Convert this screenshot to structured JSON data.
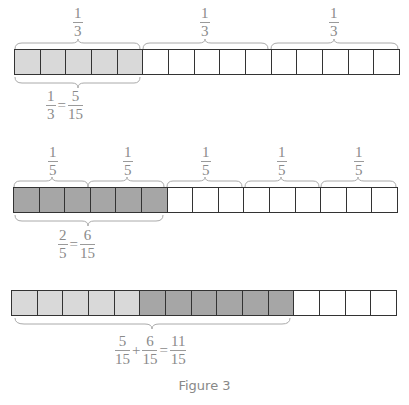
{
  "colors": {
    "light_fill": "#d9d9d9",
    "dark_fill": "#a6a6a6",
    "empty_fill": "#ffffff",
    "stroke": "#333333",
    "text": "#8a8a8a"
  },
  "rows": [
    {
      "top_labels": [
        {
          "num": "1",
          "den": "3"
        },
        {
          "num": "1",
          "den": "3"
        },
        {
          "num": "1",
          "den": "3"
        }
      ],
      "cells": [
        "light",
        "light",
        "light",
        "light",
        "light",
        "empty",
        "empty",
        "empty",
        "empty",
        "empty",
        "empty",
        "empty",
        "empty",
        "empty",
        "empty"
      ],
      "equation": {
        "lhs": {
          "num": "1",
          "den": "3"
        },
        "op": "=",
        "rhs": {
          "num": "5",
          "den": "15"
        }
      }
    },
    {
      "top_labels": [
        {
          "num": "1",
          "den": "5"
        },
        {
          "num": "1",
          "den": "5"
        },
        {
          "num": "1",
          "den": "5"
        },
        {
          "num": "1",
          "den": "5"
        },
        {
          "num": "1",
          "den": "5"
        }
      ],
      "cells": [
        "dark",
        "dark",
        "dark",
        "dark",
        "dark",
        "dark",
        "empty",
        "empty",
        "empty",
        "empty",
        "empty",
        "empty",
        "empty",
        "empty",
        "empty"
      ],
      "equation": {
        "lhs": {
          "num": "2",
          "den": "5"
        },
        "op": "=",
        "rhs": {
          "num": "6",
          "den": "15"
        }
      }
    },
    {
      "cells": [
        "light",
        "light",
        "light",
        "light",
        "light",
        "dark",
        "dark",
        "dark",
        "dark",
        "dark",
        "dark",
        "empty",
        "empty",
        "empty",
        "empty"
      ],
      "equation": {
        "a": {
          "num": "5",
          "den": "15"
        },
        "plus": "+",
        "b": {
          "num": "6",
          "den": "15"
        },
        "eq": "=",
        "c": {
          "num": "11",
          "den": "15"
        }
      }
    }
  ],
  "caption": "Figure 3"
}
